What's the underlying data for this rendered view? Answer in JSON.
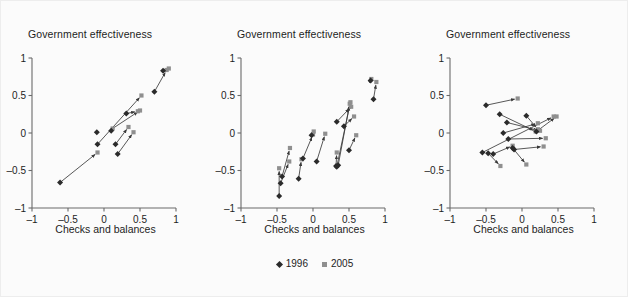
{
  "figure": {
    "background_color": "#fbfbfb",
    "marker_1996_color": "#2b2b2b",
    "marker_2005_color": "#8f8f8f",
    "arrow_color": "#3a3a3a",
    "axis_color": "#6b6b6b"
  },
  "legend": {
    "position": "bottom-center",
    "items": [
      {
        "label": "1996",
        "marker": "diamond-marker-icon",
        "color": "#2b2b2b"
      },
      {
        "label": "2005",
        "marker": "square-marker-icon",
        "color": "#8f8f8f"
      }
    ]
  },
  "chart_data": [
    {
      "type": "scatter",
      "panel": 1,
      "title": "Government effectiveness",
      "ylabel": "Government effectiveness",
      "xlabel": "Checks and balances",
      "xlim": [
        -1,
        1
      ],
      "ylim": [
        -1,
        1
      ],
      "xticks": [
        -1,
        -0.5,
        0,
        0.5,
        1
      ],
      "xticklabels": [
        "–1",
        "–0.5",
        "0",
        "0.5",
        "1"
      ],
      "yticks": [
        -1,
        -0.5,
        0,
        0.5,
        1
      ],
      "yticklabels": [
        "–1",
        "–0.5",
        "0",
        "0.5",
        "1"
      ],
      "grid": false,
      "series": [
        {
          "name": "1996",
          "marker": "diamond",
          "color": "#2b2b2b"
        },
        {
          "name": "2005",
          "marker": "square",
          "color": "#8f8f8f"
        }
      ],
      "arrows": [
        {
          "x1": -0.61,
          "y1": -0.66,
          "x2": -0.09,
          "y2": -0.26
        },
        {
          "x1": -0.09,
          "y1": -0.26,
          "x2": -0.09,
          "y2": -0.26
        },
        {
          "x1": -0.1,
          "y1": 0.01,
          "x2": -0.1,
          "y2": 0.01
        },
        {
          "x1": -0.09,
          "y1": -0.15,
          "x2": 0.52,
          "y2": 0.5
        },
        {
          "x1": 0.1,
          "y1": 0.03,
          "x2": 0.12,
          "y2": 0.06
        },
        {
          "x1": 0.12,
          "y1": 0.06,
          "x2": 0.5,
          "y2": 0.3
        },
        {
          "x1": 0.16,
          "y1": -0.15,
          "x2": 0.34,
          "y2": 0.08
        },
        {
          "x1": 0.19,
          "y1": -0.28,
          "x2": 0.41,
          "y2": 0.01
        },
        {
          "x1": 0.31,
          "y1": 0.26,
          "x2": 0.47,
          "y2": 0.29
        },
        {
          "x1": 0.7,
          "y1": 0.55,
          "x2": 0.87,
          "y2": 0.84
        },
        {
          "x1": 0.82,
          "y1": 0.83,
          "x2": 0.9,
          "y2": 0.86
        }
      ],
      "points_1996": [
        {
          "x": -0.61,
          "y": -0.66
        },
        {
          "x": -0.1,
          "y": 0.01
        },
        {
          "x": -0.09,
          "y": -0.15
        },
        {
          "x": 0.1,
          "y": 0.03
        },
        {
          "x": 0.16,
          "y": -0.15
        },
        {
          "x": 0.19,
          "y": -0.28
        },
        {
          "x": 0.31,
          "y": 0.26
        },
        {
          "x": 0.7,
          "y": 0.55
        },
        {
          "x": 0.82,
          "y": 0.83
        }
      ],
      "points_2005": [
        {
          "x": -0.09,
          "y": -0.26
        },
        {
          "x": 0.12,
          "y": 0.06
        },
        {
          "x": 0.34,
          "y": 0.08
        },
        {
          "x": 0.41,
          "y": 0.01
        },
        {
          "x": 0.47,
          "y": 0.29
        },
        {
          "x": 0.5,
          "y": 0.3
        },
        {
          "x": 0.52,
          "y": 0.5
        },
        {
          "x": 0.87,
          "y": 0.84
        },
        {
          "x": 0.9,
          "y": 0.86
        }
      ]
    },
    {
      "type": "scatter",
      "panel": 2,
      "title": "Government effectiveness",
      "ylabel": "Government effectiveness",
      "xlabel": "Checks and balances",
      "xlim": [
        -1,
        1
      ],
      "ylim": [
        -1,
        1
      ],
      "xticks": [
        -1,
        -0.5,
        0,
        0.5,
        1
      ],
      "xticklabels": [
        "–1",
        "–0.5",
        "0",
        "0.5",
        "1"
      ],
      "yticks": [
        -1,
        -0.5,
        0,
        0.5,
        1
      ],
      "yticklabels": [
        "–1",
        "–0.5",
        "0",
        "0.5",
        "1"
      ],
      "grid": false,
      "series": [
        {
          "name": "1996",
          "marker": "diamond",
          "color": "#2b2b2b"
        },
        {
          "name": "2005",
          "marker": "square",
          "color": "#8f8f8f"
        }
      ],
      "arrows": [
        {
          "x1": -0.47,
          "y1": -0.84,
          "x2": -0.47,
          "y2": -0.47
        },
        {
          "x1": -0.45,
          "y1": -0.67,
          "x2": -0.33,
          "y2": -0.38
        },
        {
          "x1": -0.43,
          "y1": -0.58,
          "x2": -0.32,
          "y2": -0.2
        },
        {
          "x1": -0.2,
          "y1": -0.61,
          "x2": -0.16,
          "y2": -0.35
        },
        {
          "x1": -0.14,
          "y1": -0.34,
          "x2": 0.0,
          "y2": -0.02
        },
        {
          "x1": -0.02,
          "y1": -0.03,
          "x2": 0.01,
          "y2": 0.02
        },
        {
          "x1": 0.05,
          "y1": -0.38,
          "x2": 0.17,
          "y2": -0.01
        },
        {
          "x1": 0.32,
          "y1": -0.44,
          "x2": 0.33,
          "y2": -0.26
        },
        {
          "x1": 0.33,
          "y1": -0.45,
          "x2": 0.52,
          "y2": 0.41
        },
        {
          "x1": 0.35,
          "y1": -0.43,
          "x2": 0.51,
          "y2": 0.39
        },
        {
          "x1": 0.33,
          "y1": 0.15,
          "x2": 0.53,
          "y2": 0.35
        },
        {
          "x1": 0.43,
          "y1": 0.09,
          "x2": 0.57,
          "y2": 0.22
        },
        {
          "x1": 0.5,
          "y1": -0.23,
          "x2": 0.6,
          "y2": -0.03
        },
        {
          "x1": 0.8,
          "y1": 0.7,
          "x2": 0.81,
          "y2": 0.72
        },
        {
          "x1": 0.84,
          "y1": 0.45,
          "x2": 0.88,
          "y2": 0.68
        }
      ],
      "points_1996": [
        {
          "x": -0.47,
          "y": -0.84
        },
        {
          "x": -0.45,
          "y": -0.67
        },
        {
          "x": -0.43,
          "y": -0.58
        },
        {
          "x": -0.2,
          "y": -0.61
        },
        {
          "x": -0.14,
          "y": -0.34
        },
        {
          "x": -0.02,
          "y": -0.03
        },
        {
          "x": 0.05,
          "y": -0.38
        },
        {
          "x": 0.32,
          "y": -0.44
        },
        {
          "x": 0.33,
          "y": -0.45
        },
        {
          "x": 0.35,
          "y": -0.43
        },
        {
          "x": 0.33,
          "y": 0.15
        },
        {
          "x": 0.43,
          "y": 0.09
        },
        {
          "x": 0.5,
          "y": -0.23
        },
        {
          "x": 0.8,
          "y": 0.7
        },
        {
          "x": 0.84,
          "y": 0.45
        }
      ],
      "points_2005": [
        {
          "x": -0.47,
          "y": -0.47
        },
        {
          "x": -0.33,
          "y": -0.38
        },
        {
          "x": -0.32,
          "y": -0.2
        },
        {
          "x": -0.16,
          "y": -0.35
        },
        {
          "x": 0.0,
          "y": -0.02
        },
        {
          "x": 0.01,
          "y": 0.02
        },
        {
          "x": 0.17,
          "y": -0.01
        },
        {
          "x": 0.33,
          "y": -0.26
        },
        {
          "x": 0.51,
          "y": 0.39
        },
        {
          "x": 0.52,
          "y": 0.41
        },
        {
          "x": 0.53,
          "y": 0.35
        },
        {
          "x": 0.57,
          "y": 0.22
        },
        {
          "x": 0.6,
          "y": -0.03
        },
        {
          "x": 0.81,
          "y": 0.72
        },
        {
          "x": 0.88,
          "y": 0.68
        }
      ]
    },
    {
      "type": "scatter",
      "panel": 3,
      "title": "Government effectiveness",
      "ylabel": "Government effectiveness",
      "xlabel": "Checks and balances",
      "xlim": [
        -1,
        1
      ],
      "ylim": [
        -1,
        1
      ],
      "xticks": [
        -1,
        -0.5,
        0,
        0.5,
        1
      ],
      "xticklabels": [
        "–1",
        "–0.5",
        "0",
        "0.5",
        "1"
      ],
      "yticks": [
        -1,
        -0.5,
        0,
        0.5,
        1
      ],
      "yticklabels": [
        "–1",
        "–0.5",
        "0",
        "0.5",
        "1"
      ],
      "grid": false,
      "series": [
        {
          "name": "1996",
          "marker": "diamond",
          "color": "#2b2b2b"
        },
        {
          "name": "2005",
          "marker": "square",
          "color": "#8f8f8f"
        }
      ],
      "arrows": [
        {
          "x1": -0.5,
          "y1": 0.37,
          "x2": -0.06,
          "y2": 0.46
        },
        {
          "x1": -0.31,
          "y1": 0.25,
          "x2": 0.19,
          "y2": 0.02
        },
        {
          "x1": -0.26,
          "y1": 0.0,
          "x2": 0.22,
          "y2": 0.13
        },
        {
          "x1": -0.21,
          "y1": 0.14,
          "x2": 0.25,
          "y2": 0.03
        },
        {
          "x1": -0.19,
          "y1": -0.08,
          "x2": 0.33,
          "y2": -0.07
        },
        {
          "x1": -0.55,
          "y1": -0.26,
          "x2": 0.44,
          "y2": 0.22
        },
        {
          "x1": -0.47,
          "y1": -0.27,
          "x2": -0.3,
          "y2": -0.44
        },
        {
          "x1": -0.4,
          "y1": -0.28,
          "x2": -0.13,
          "y2": -0.17
        },
        {
          "x1": -0.13,
          "y1": -0.2,
          "x2": 0.06,
          "y2": -0.42
        },
        {
          "x1": -0.11,
          "y1": -0.22,
          "x2": 0.3,
          "y2": -0.18
        },
        {
          "x1": 0.06,
          "y1": 0.23,
          "x2": 0.22,
          "y2": 0.05
        },
        {
          "x1": 0.2,
          "y1": 0.02,
          "x2": 0.48,
          "y2": 0.22
        }
      ],
      "points_1996": [
        {
          "x": -0.5,
          "y": 0.37
        },
        {
          "x": -0.31,
          "y": 0.25
        },
        {
          "x": -0.26,
          "y": 0.0
        },
        {
          "x": -0.21,
          "y": 0.14
        },
        {
          "x": -0.19,
          "y": -0.08
        },
        {
          "x": -0.55,
          "y": -0.26
        },
        {
          "x": -0.47,
          "y": -0.27
        },
        {
          "x": -0.4,
          "y": -0.28
        },
        {
          "x": -0.13,
          "y": -0.2
        },
        {
          "x": -0.11,
          "y": -0.22
        },
        {
          "x": 0.06,
          "y": 0.23
        },
        {
          "x": 0.2,
          "y": 0.02
        }
      ],
      "points_2005": [
        {
          "x": -0.06,
          "y": 0.46
        },
        {
          "x": 0.19,
          "y": 0.02
        },
        {
          "x": 0.22,
          "y": 0.13
        },
        {
          "x": 0.25,
          "y": 0.03
        },
        {
          "x": 0.33,
          "y": -0.07
        },
        {
          "x": 0.44,
          "y": 0.22
        },
        {
          "x": -0.3,
          "y": -0.44
        },
        {
          "x": -0.13,
          "y": -0.17
        },
        {
          "x": 0.06,
          "y": -0.42
        },
        {
          "x": 0.3,
          "y": -0.18
        },
        {
          "x": 0.22,
          "y": 0.05
        },
        {
          "x": 0.48,
          "y": 0.22
        }
      ]
    }
  ]
}
